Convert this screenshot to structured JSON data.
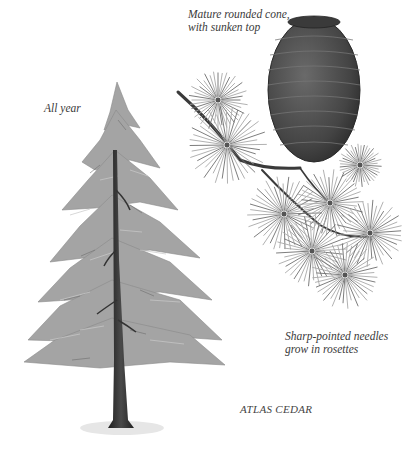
{
  "illustration": {
    "title": "ATLAS CEDAR",
    "labels": {
      "cone_line1": "Mature rounded cone,",
      "cone_line2": "with sunken top",
      "season": "All year",
      "needles_line1": "Sharp-pointed needles",
      "needles_line2": "grow in rosettes"
    },
    "colors": {
      "background": "#ffffff",
      "foliage": "#9a9a9a",
      "trunk": "#2e2e2e",
      "cone": "#4a4a4a",
      "text": "#3a3a3a"
    },
    "rosettes": [
      {
        "cx": 218,
        "cy": 100,
        "r": 30
      },
      {
        "cx": 227,
        "cy": 145,
        "r": 40
      },
      {
        "cx": 284,
        "cy": 214,
        "r": 38
      },
      {
        "cx": 330,
        "cy": 203,
        "r": 34
      },
      {
        "cx": 312,
        "cy": 251,
        "r": 36
      },
      {
        "cx": 370,
        "cy": 233,
        "r": 34
      },
      {
        "cx": 345,
        "cy": 275,
        "r": 34
      },
      {
        "cx": 360,
        "cy": 165,
        "r": 22
      }
    ]
  }
}
